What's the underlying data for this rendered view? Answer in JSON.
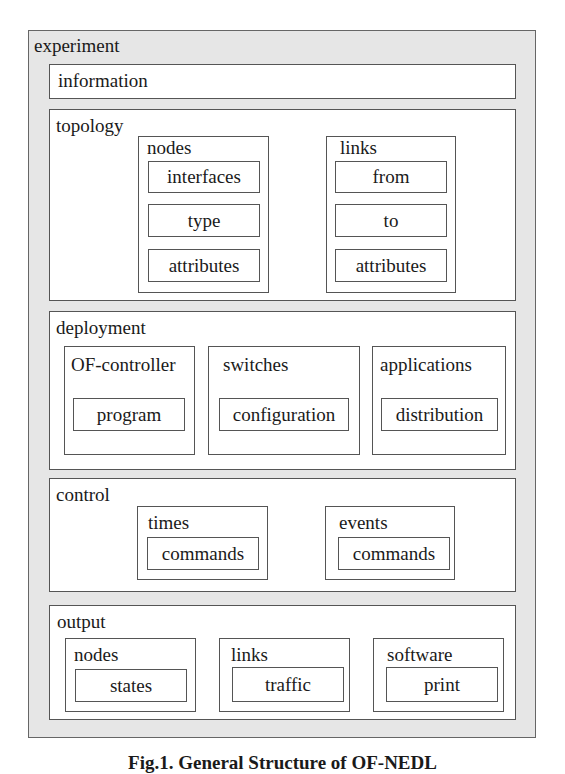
{
  "diagram": {
    "root": "experiment",
    "information": "information",
    "topology": {
      "label": "topology",
      "nodes": {
        "label": "nodes",
        "items": [
          "interfaces",
          "type",
          "attributes"
        ]
      },
      "links": {
        "label": "links",
        "items": [
          "from",
          "to",
          "attributes"
        ]
      }
    },
    "deployment": {
      "label": "deployment",
      "groups": [
        {
          "label": "OF-controller",
          "item": "program"
        },
        {
          "label": "switches",
          "item": "configuration"
        },
        {
          "label": "applications",
          "item": "distribution"
        }
      ]
    },
    "control": {
      "label": "control",
      "groups": [
        {
          "label": "times",
          "item": "commands"
        },
        {
          "label": "events",
          "item": "commands"
        }
      ]
    },
    "output": {
      "label": "output",
      "groups": [
        {
          "label": "nodes",
          "item": "states"
        },
        {
          "label": "links",
          "item": "traffic"
        },
        {
          "label": "software",
          "item": "print"
        }
      ]
    },
    "caption": "Fig.1. General Structure of OF-NEDL"
  },
  "colors": {
    "outer_bg": "#e6e6e6",
    "box_bg": "#ffffff",
    "border": "#555555"
  }
}
